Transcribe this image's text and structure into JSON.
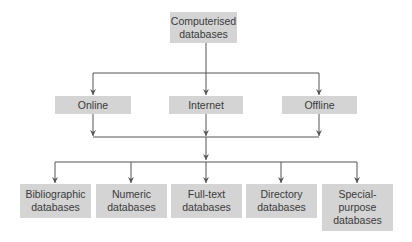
{
  "diagram": {
    "root": {
      "label": "Computerised databases",
      "line1": "Computerised",
      "line2": "databases"
    },
    "access_modes": [
      {
        "label": "Online"
      },
      {
        "label": "Internet"
      },
      {
        "label": "Offline"
      }
    ],
    "database_types": [
      {
        "line1": "Bibliographic",
        "line2": "databases",
        "line3": ""
      },
      {
        "line1": "Numeric",
        "line2": "databases",
        "line3": ""
      },
      {
        "line1": "Full-text",
        "line2": "databases",
        "line3": ""
      },
      {
        "line1": "Directory",
        "line2": "databases",
        "line3": ""
      },
      {
        "line1": "Special-",
        "line2": "purpose",
        "line3": "databases"
      }
    ],
    "colors": {
      "box_fill": "#d4d4d4",
      "line": "#555555",
      "text": "#3a3a3a"
    }
  }
}
